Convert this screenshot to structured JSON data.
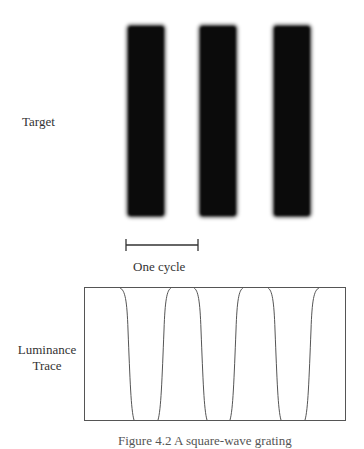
{
  "figure": {
    "target_label": "Target",
    "cycle_label": "One cycle",
    "trace_label_line1": "Luminance",
    "trace_label_line2": "Trace",
    "caption": "Figure 4.2 A square-wave grating"
  },
  "colors": {
    "bar": "#0b0b0b",
    "line": "#444444",
    "background": "#ffffff"
  },
  "target": {
    "bars": [
      {
        "x": 127,
        "width": 38
      },
      {
        "x": 199,
        "width": 38
      },
      {
        "x": 273,
        "width": 38
      }
    ],
    "top": 25,
    "bottom": 217
  },
  "scale_bar": {
    "x1": 126,
    "x2": 198,
    "y": 245
  },
  "trace_box": {
    "x": 84,
    "y": 287,
    "width": 261,
    "height": 133
  }
}
